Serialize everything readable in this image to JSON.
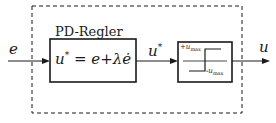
{
  "diagram": {
    "type": "block-diagram",
    "input_label": "e",
    "output_label": "u",
    "group_label": "PD-Regler",
    "pd_block": {
      "formula_lhs": "u",
      "formula_sup": "*",
      "formula_eq": "=",
      "formula_rhs": "e+λė"
    },
    "intermediate_signal": {
      "label": "u",
      "sup": "*"
    },
    "saturation_block": {
      "upper_label": "+u",
      "upper_sub": "max",
      "lower_label": "-u",
      "lower_sub": "max"
    },
    "colors": {
      "line": "#1a1a1a",
      "background": "#ffffff"
    }
  }
}
